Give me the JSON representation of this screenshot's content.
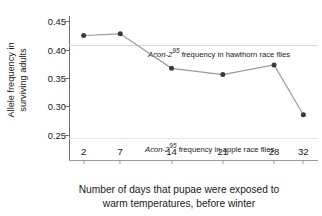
{
  "chart_data": {
    "type": "line",
    "title": "",
    "xlabel": "Number of days that pupae were exposed to warm temperatures, before winter",
    "xlabel_line1": "Number of days that pupae were exposed to",
    "xlabel_line2": "warm temperatures, before winter",
    "ylabel": "Allele frequency in surviving adults",
    "ylabel_line1": "Allele frequency in",
    "ylabel_line2": "surviving adults",
    "x": [
      2,
      7,
      14,
      21,
      28,
      32
    ],
    "xtick_labels": [
      "2",
      "7",
      "14",
      "21",
      "28",
      "32"
    ],
    "values": [
      0.425,
      0.428,
      0.367,
      0.356,
      0.373,
      0.285
    ],
    "ytick_labels": [
      "0.45",
      "0.40",
      "0.35",
      "0.30",
      "0.25"
    ],
    "yticks": [
      0.45,
      0.4,
      0.35,
      0.3,
      0.25
    ],
    "ylim": [
      0.205,
      0.463
    ],
    "xlim": [
      0,
      34
    ],
    "grid": false,
    "legend": "none",
    "series_name": "Allele frequency in surviving adults",
    "marker": "filled-circle",
    "marker_color": "#3a3a3a",
    "line_color": "#9a9a9a",
    "reference_lines": [
      {
        "name": "hawthorn-reference-line",
        "value": 0.408,
        "color": "#d8d8d8",
        "label_italic": "Acon-2",
        "label_superscript": "95",
        "label_rest": " frequency in hawthorn race flies",
        "label_full": "Acon-2 95 frequency in hawthorn race flies"
      },
      {
        "name": "apple-reference-line",
        "value": 0.243,
        "color": "#e8e8e8",
        "label_italic": "Acon-2",
        "label_superscript": "95",
        "label_rest": " frequency in apple race flies",
        "label_full": "Acon-2 95 frequency in apple race flies"
      }
    ]
  }
}
